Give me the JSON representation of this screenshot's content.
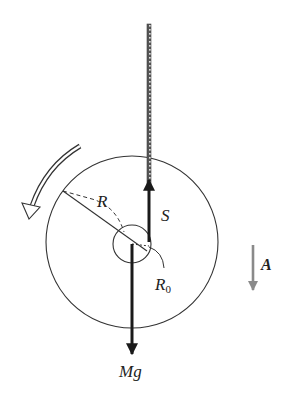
{
  "diagram": {
    "labels": {
      "radius_outer": "R",
      "radius_inner": "R",
      "radius_inner_sub": "0",
      "tension": "S",
      "weight": "Mg",
      "acceleration": "A"
    },
    "elements": {
      "outer_disk": {
        "cx": 132,
        "cy": 242,
        "r": 86
      },
      "inner_axle": {
        "cx": 132,
        "cy": 244,
        "r": 19
      },
      "string": {
        "x": 149,
        "y_top": 24,
        "y_bottom": 190
      },
      "tension_arrow": {
        "direction": "up"
      },
      "weight_arrow": {
        "direction": "down"
      },
      "rotation_arrow": {
        "direction": "counterclockwise"
      },
      "acceleration_arrow": {
        "direction": "down",
        "color": "#8a8a8a"
      }
    },
    "colors": {
      "line": "#333333",
      "arrow": "#1a1a1a",
      "accel_arrow": "#8a8a8a",
      "background": "#ffffff"
    }
  }
}
